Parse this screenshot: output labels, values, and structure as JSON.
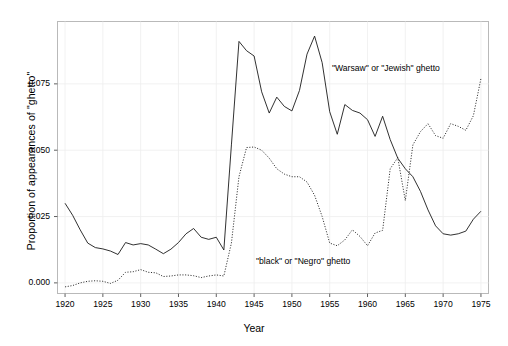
{
  "axes": {
    "xlabel": "Year",
    "ylabel": "Proportion of appearances of \"ghetto\"",
    "xticks": [
      "1920",
      "1925",
      "1930",
      "1935",
      "1940",
      "1945",
      "1950",
      "1955",
      "1960",
      "1965",
      "1970",
      "1975"
    ],
    "yticks": [
      "0.000",
      "0.025",
      "0.050",
      "0.075"
    ]
  },
  "annotations": {
    "warsaw": "\"Warsaw\" or \"Jewish\" ghetto",
    "black": "\"black\" or \"Negro\" ghetto"
  },
  "chart_data": {
    "type": "line",
    "title": "",
    "xlabel": "Year",
    "ylabel": "Proportion of appearances of \"ghetto\"",
    "xlim": [
      1919,
      1976
    ],
    "ylim": [
      -0.004,
      0.0985
    ],
    "xticks": [
      1920,
      1925,
      1930,
      1935,
      1940,
      1945,
      1950,
      1955,
      1960,
      1965,
      1970,
      1975
    ],
    "yticks": [
      0.0,
      0.025,
      0.05,
      0.075
    ],
    "grid": true,
    "legend": "inline-annotations",
    "x": [
      1920,
      1921,
      1922,
      1923,
      1924,
      1925,
      1926,
      1927,
      1928,
      1929,
      1930,
      1931,
      1932,
      1933,
      1934,
      1935,
      1936,
      1937,
      1938,
      1939,
      1940,
      1941,
      1942,
      1943,
      1944,
      1945,
      1946,
      1947,
      1948,
      1949,
      1950,
      1951,
      1952,
      1953,
      1954,
      1955,
      1956,
      1957,
      1958,
      1959,
      1960,
      1961,
      1962,
      1963,
      1964,
      1965,
      1966,
      1967,
      1968,
      1969,
      1970,
      1971,
      1972,
      1973,
      1974,
      1975
    ],
    "series": [
      {
        "name": "\"Warsaw\" or \"Jewish\" ghetto",
        "style": "solid",
        "color": "#000000",
        "values": [
          0.03,
          0.0255,
          0.02,
          0.015,
          0.0133,
          0.0128,
          0.012,
          0.0107,
          0.0152,
          0.0143,
          0.0148,
          0.0143,
          0.0127,
          0.011,
          0.0127,
          0.0152,
          0.0185,
          0.0205,
          0.0172,
          0.0164,
          0.0172,
          0.0124,
          0.052,
          0.091,
          0.0875,
          0.0855,
          0.072,
          0.064,
          0.07,
          0.0665,
          0.0648,
          0.0725,
          0.0862,
          0.093,
          0.083,
          0.0645,
          0.056,
          0.0672,
          0.065,
          0.064,
          0.0615,
          0.0552,
          0.0628,
          0.054,
          0.047,
          0.043,
          0.04,
          0.0345,
          0.0275,
          0.0215,
          0.0185,
          0.018,
          0.0185,
          0.0195,
          0.024,
          0.027
        ]
      },
      {
        "name": "\"black\" or \"Negro\" ghetto",
        "style": "dotted",
        "color": "#000000",
        "values": [
          -0.0015,
          -0.001,
          0.0,
          0.0006,
          0.0008,
          0.0006,
          -0.0002,
          0.001,
          0.004,
          0.0042,
          0.005,
          0.004,
          0.0038,
          0.0024,
          0.0026,
          0.003,
          0.003,
          0.0027,
          0.002,
          0.0026,
          0.003,
          0.0026,
          0.015,
          0.04,
          0.051,
          0.0512,
          0.05,
          0.047,
          0.043,
          0.041,
          0.04,
          0.04,
          0.038,
          0.033,
          0.025,
          0.015,
          0.014,
          0.0162,
          0.02,
          0.0175,
          0.014,
          0.0188,
          0.0198,
          0.043,
          0.0472,
          0.031,
          0.052,
          0.057,
          0.06,
          0.0555,
          0.0545,
          0.06,
          0.059,
          0.0575,
          0.063,
          0.077
        ]
      }
    ]
  }
}
